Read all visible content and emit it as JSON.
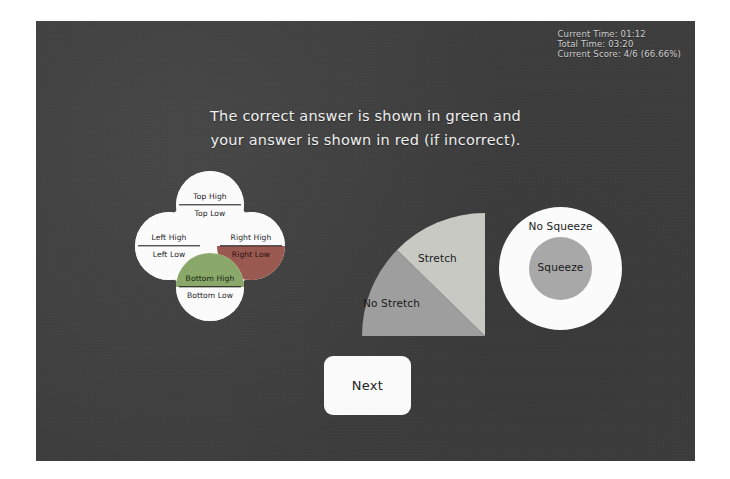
{
  "hud": {
    "current_time": "Current Time: 01:12",
    "total_time": "Total Time: 03:20",
    "current_score": "Current Score: 4/6 (66.66%)"
  },
  "instructions": {
    "line1": "The correct answer is shown in green and",
    "line2": "your answer is shown in red (if incorrect)."
  },
  "direction_widget": {
    "top": {
      "high": "Top High",
      "low": "Top Low"
    },
    "bottom": {
      "high": "Bottom High",
      "low": "Bottom Low"
    },
    "left": {
      "high": "Left High",
      "low": "Left Low"
    },
    "right": {
      "high": "Right High",
      "low": "Right Low"
    }
  },
  "stretch_widget": {
    "stretch": "Stretch",
    "no_stretch": "No Stretch"
  },
  "squeeze_widget": {
    "no_squeeze": "No Squeeze",
    "squeeze": "Squeeze"
  },
  "footer": {
    "next_label": "Next"
  },
  "colors": {
    "panel_background": "#3c3c3c",
    "correct_green": "#8aa86a",
    "incorrect_red": "#9a5a52",
    "shape_white": "#fbfbfb",
    "shape_gray": "#a8a8a8",
    "hud_text": "#cfcfcf"
  }
}
